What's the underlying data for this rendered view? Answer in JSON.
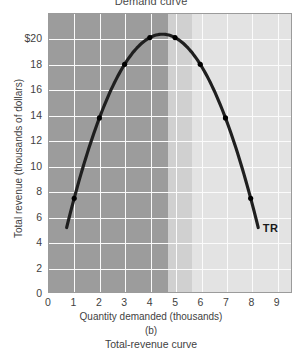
{
  "figure": {
    "top_title": "Demand curve",
    "panel_letter": "(b)",
    "bottom_caption": "Total-revenue curve"
  },
  "chart_data": {
    "type": "line",
    "title": "Total-revenue curve",
    "xlabel": "Quantity demanded (thousands)",
    "ylabel": "Total revenue (thousands of dollars)",
    "xlim": [
      0,
      9.6
    ],
    "ylim": [
      0,
      22
    ],
    "grid": true,
    "legend_position": "inline-annotation",
    "series": [
      {
        "name": "TR",
        "label": "TR",
        "color": "#1f1f1f",
        "x": [
          0.7,
          1,
          2,
          3,
          4,
          4.5,
          5,
          6,
          7,
          8,
          8.3
        ],
        "values": [
          5.1,
          8,
          14,
          18,
          20,
          20.4,
          20,
          18,
          14,
          8,
          5.1
        ],
        "marked_points_x": [
          1,
          2,
          3,
          4,
          5,
          6,
          7,
          8
        ],
        "marked_points_y": [
          8,
          14,
          18,
          20,
          20,
          18,
          14,
          8
        ]
      }
    ],
    "xticks": [
      "0",
      "1",
      "2",
      "3",
      "4",
      "5",
      "6",
      "7",
      "8",
      "9"
    ],
    "xtick_values": [
      0,
      1,
      2,
      3,
      4,
      5,
      6,
      7,
      8,
      9
    ],
    "yticks": [
      "0",
      "2",
      "4",
      "6",
      "8",
      "10",
      "12",
      "14",
      "16",
      "18",
      "$20"
    ],
    "ytick_values": [
      0,
      2,
      4,
      6,
      8,
      10,
      12,
      14,
      16,
      18,
      20
    ],
    "shaded_bands": [
      {
        "name": "elastic-region",
        "x_from": 0,
        "x_to": 4.5,
        "color": "#9c9c9c"
      },
      {
        "name": "unit-elastic-region",
        "x_from": 4.5,
        "x_to": 5.4,
        "color": "#d0d0d0"
      },
      {
        "name": "inelastic-region",
        "x_from": 5.4,
        "x_to": 9.6,
        "color": "#e3e3e3"
      }
    ],
    "annotations": [
      {
        "text": "TR",
        "x": 8.45,
        "y": 5.6
      }
    ]
  }
}
